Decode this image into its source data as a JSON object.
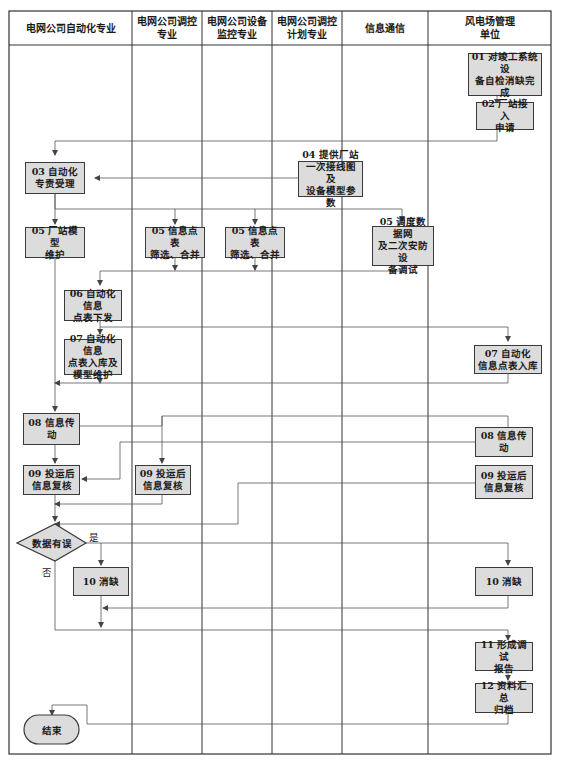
{
  "diagram": {
    "type": "swimlane-flowchart",
    "lanes": [
      {
        "id": "lane1",
        "label": "电网公司自动化专业"
      },
      {
        "id": "lane2",
        "label": "电网公司调控\n专业"
      },
      {
        "id": "lane3",
        "label": "电网公司设备\n监控专业"
      },
      {
        "id": "lane4",
        "label": "电网公司调控\n计划专业"
      },
      {
        "id": "lane5",
        "label": "信息通信"
      },
      {
        "id": "lane6",
        "label": "风电场管理\n单位"
      }
    ],
    "nodes": {
      "n01": "01 对竣工系统设\n备自检消缺完成",
      "n02": "02 厂站接入\n申请",
      "n03": "03 自动化\n专责受理",
      "n04": "04 提供厂站\n一次接线图及\n设备模型参数",
      "n05a": "05 厂站模型\n维护",
      "n05b": "05 信息点表\n筛选、合并",
      "n05c": "05 信息点表\n筛选、合并",
      "n05d": "05 调度数据网\n及二次安防设\n备调试",
      "n06": "06 自动化信息\n点表下发",
      "n07a": "07 自动化信息\n点表入库及\n模型维护",
      "n07b": "07 自动化\n信息点表入库",
      "n08a": "08 信息传动",
      "n08b": "08 信息传动",
      "n09a": "09 投运后\n信息复核",
      "n09b": "09 投运后\n信息复核",
      "n09c": "09 投运后\n信息复核",
      "decision": "数据有误",
      "n10a": "10 消缺",
      "n10b": "10 消缺",
      "n11": "11 形成调试\n报告",
      "n12": "12 资料汇总\n归档",
      "end": "结束"
    },
    "edge_labels": {
      "yes": "是",
      "no": "否"
    },
    "colors": {
      "box_fill": "#dcdcdc",
      "box_border": "#3a3a3a",
      "line": "#555555"
    }
  }
}
